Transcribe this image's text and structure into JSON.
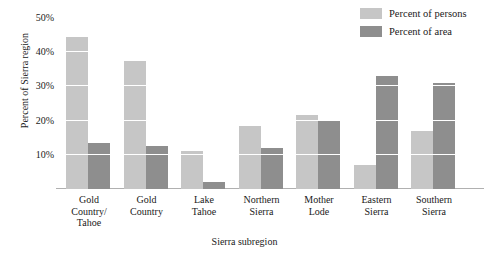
{
  "chart_data": {
    "type": "bar",
    "title": "",
    "xlabel": "Sierra subregion",
    "ylabel": "Percent of Sierra region",
    "categories": [
      "Gold Country/ Tahoe",
      "Gold Country",
      "Lake Tahoe",
      "Northern Sierra",
      "Mother Lode",
      "Eastern Sierra",
      "Southern Sierra"
    ],
    "category_lines": [
      [
        "Gold",
        "Country/",
        "Tahoe"
      ],
      [
        "Gold",
        "Country"
      ],
      [
        "Lake",
        "Tahoe"
      ],
      [
        "Northern",
        "Sierra"
      ],
      [
        "Mother",
        "Lode"
      ],
      [
        "Eastern",
        "Sierra"
      ],
      [
        "Southern",
        "Sierra"
      ]
    ],
    "series": [
      {
        "name": "Percent of persons",
        "color": "#c6c6c6",
        "values": [
          44.5,
          37.5,
          11,
          18.5,
          21.5,
          7,
          17
        ]
      },
      {
        "name": "Percent of area",
        "color": "#8e8e8e",
        "values": [
          13.5,
          12.5,
          2,
          12,
          20,
          33,
          31
        ]
      }
    ],
    "ylim": [
      0,
      50
    ],
    "yticks": [
      10,
      20,
      30,
      40,
      50
    ],
    "ytick_labels": [
      "10%",
      "20%",
      "30%",
      "40%",
      "50%"
    ],
    "grid": true,
    "grid_color": "#ffffff",
    "legend_position": "top-right",
    "axis_color": "#b0b0b0",
    "background": "#ffffff"
  }
}
